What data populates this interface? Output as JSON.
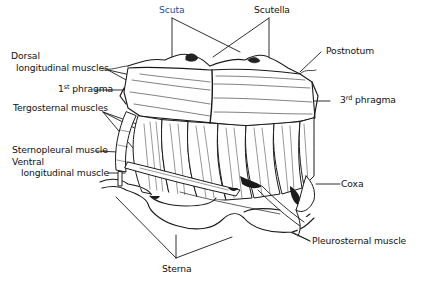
{
  "diagram": {
    "labels": {
      "scuta": "Scuta",
      "scutella": "Scutella",
      "dorsal_line1": "Dorsal",
      "dorsal_line2": "longitudinal muscles",
      "phragma1_num": "1",
      "phragma1_sup": "st",
      "phragma1_word": "phragma",
      "tergosternal": "Tergosternal muscles",
      "sternopleural": "Sternopleural muscle",
      "ventral_line1": "Ventral",
      "ventral_line2": "longitudinal muscle",
      "postnotum": "Postnotum",
      "phragma3_num": "3",
      "phragma3_sup": "rd",
      "phragma3_word": "phragma",
      "coxa": "Coxa",
      "pleurosternal": "Pleurosternal muscle",
      "sterna": "Sterna"
    },
    "colors": {
      "line": "#1a1a1a",
      "scuta_label": "#2a4f9c",
      "background": "#ffffff"
    }
  }
}
